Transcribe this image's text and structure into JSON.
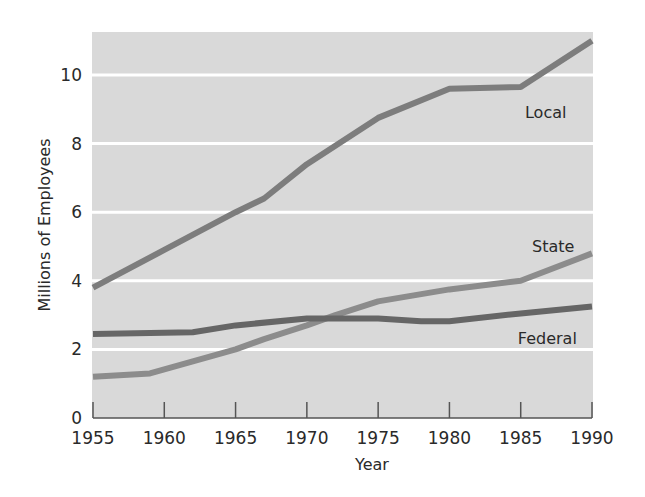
{
  "chart_data": {
    "type": "line",
    "title": "",
    "xlabel": "Year",
    "ylabel": "Millions of Employees",
    "xlim": [
      1955,
      1990
    ],
    "ylim": [
      0,
      11.2
    ],
    "x_ticks": [
      1955,
      1960,
      1965,
      1970,
      1975,
      1980,
      1985,
      1990
    ],
    "y_ticks": [
      0,
      2,
      4,
      6,
      8,
      10
    ],
    "grid": {
      "horizontal": true,
      "vertical": false,
      "color": "#ffffff"
    },
    "plot_background": "#d9d9d9",
    "legend": "inline labels",
    "series": [
      {
        "name": "Local",
        "color": "#7d7d7d",
        "label_pos": {
          "x": 1985.3,
          "y": 8.75
        },
        "points": [
          [
            1955,
            3.8
          ],
          [
            1960,
            4.9
          ],
          [
            1965,
            6.0
          ],
          [
            1967,
            6.4
          ],
          [
            1970,
            7.4
          ],
          [
            1975,
            8.75
          ],
          [
            1980,
            9.6
          ],
          [
            1985,
            9.65
          ],
          [
            1990,
            11.0
          ]
        ]
      },
      {
        "name": "State",
        "color": "#8c8c8c",
        "label_pos": {
          "x": 1985.8,
          "y": 4.85
        },
        "points": [
          [
            1955,
            1.2
          ],
          [
            1959,
            1.3
          ],
          [
            1962,
            1.65
          ],
          [
            1965,
            2.0
          ],
          [
            1967,
            2.3
          ],
          [
            1970,
            2.7
          ],
          [
            1972,
            3.0
          ],
          [
            1975,
            3.4
          ],
          [
            1980,
            3.75
          ],
          [
            1985,
            4.0
          ],
          [
            1990,
            4.8
          ]
        ]
      },
      {
        "name": "Federal",
        "color": "#666666",
        "label_pos": {
          "x": 1984.8,
          "y": 2.15
        },
        "points": [
          [
            1955,
            2.45
          ],
          [
            1962,
            2.5
          ],
          [
            1965,
            2.7
          ],
          [
            1970,
            2.9
          ],
          [
            1975,
            2.9
          ],
          [
            1978,
            2.82
          ],
          [
            1980,
            2.82
          ],
          [
            1985,
            3.05
          ],
          [
            1990,
            3.25
          ]
        ]
      }
    ]
  }
}
